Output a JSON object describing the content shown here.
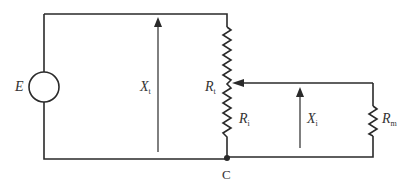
{
  "diagram": {
    "type": "circuit",
    "title": "",
    "colors": {
      "line": "#2a2a2a",
      "text": "#333333",
      "background": "#ffffff"
    },
    "components": [
      {
        "id": "E",
        "kind": "voltage-source",
        "label": "E",
        "sub": ""
      },
      {
        "id": "Rt",
        "kind": "potentiometer",
        "label": "R",
        "sub": "t"
      },
      {
        "id": "Ri",
        "kind": "resistor-segment",
        "label": "R",
        "sub": "i"
      },
      {
        "id": "Rm",
        "kind": "resistor",
        "label": "R",
        "sub": "m"
      }
    ],
    "quantities": [
      {
        "id": "Xt",
        "kind": "displacement-arrow",
        "label": "X",
        "sub": "t"
      },
      {
        "id": "Xi",
        "kind": "displacement-arrow",
        "label": "X",
        "sub": "i"
      }
    ],
    "nodes": [
      {
        "id": "C",
        "label": "C"
      }
    ]
  }
}
